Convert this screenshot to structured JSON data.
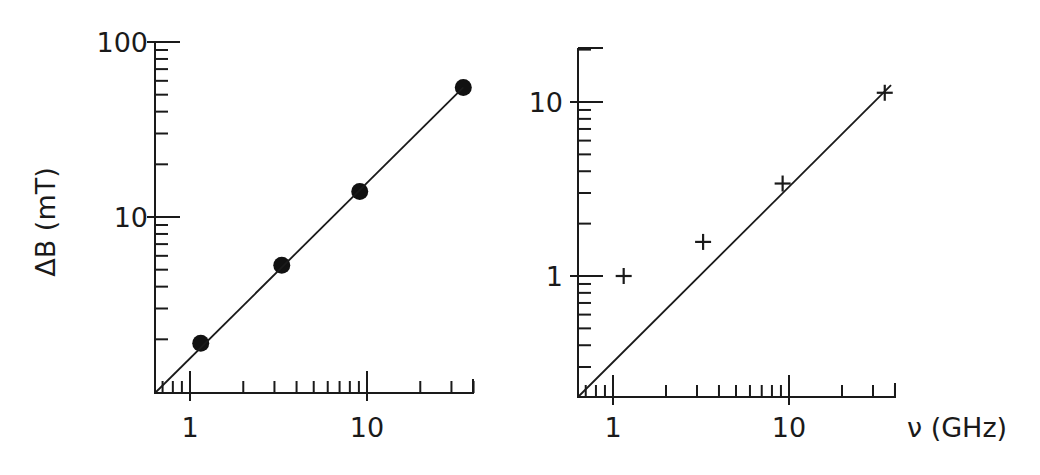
{
  "chart_data": [
    {
      "type": "scatter",
      "panel": "left",
      "title": "",
      "xlabel": "",
      "ylabel": "ΔB (mT)",
      "xscale": "log",
      "yscale": "log",
      "xlim": [
        0.63,
        40
      ],
      "ylim": [
        1,
        100
      ],
      "x_tick_labels": [
        "1",
        "10"
      ],
      "y_tick_labels": [
        "10",
        "100"
      ],
      "marker": "filled-circle",
      "grid": false,
      "series": [
        {
          "name": "data",
          "x": [
            1.15,
            3.3,
            9.1,
            35
          ],
          "y": [
            1.9,
            5.3,
            14,
            55
          ]
        },
        {
          "name": "fit",
          "kind": "line",
          "x": [
            0.63,
            35
          ],
          "y": [
            1.0,
            55
          ]
        }
      ]
    },
    {
      "type": "scatter",
      "panel": "right",
      "title": "",
      "xlabel": "ν (GHz)",
      "ylabel": "",
      "xscale": "log",
      "yscale": "log",
      "xlim": [
        0.63,
        40
      ],
      "ylim": [
        0.2,
        20
      ],
      "x_tick_labels": [
        "1",
        "10"
      ],
      "y_tick_labels": [
        "1",
        "10"
      ],
      "marker": "plus",
      "grid": false,
      "series": [
        {
          "name": "data",
          "x": [
            1.15,
            3.25,
            9.2,
            35
          ],
          "y": [
            1.0,
            1.57,
            3.4,
            11.3
          ]
        },
        {
          "name": "fit",
          "kind": "line",
          "x": [
            0.63,
            38
          ],
          "y": [
            0.2,
            12.5
          ]
        }
      ]
    }
  ],
  "labels": {
    "left_ylabel": "ΔB (mT)",
    "left_x_ticks": [
      "1",
      "10"
    ],
    "left_y_ticks": [
      "10",
      "100"
    ],
    "right_xlabel": "ν (GHz)",
    "right_x_ticks": [
      "1",
      "10"
    ],
    "right_y_ticks": [
      "1",
      "10"
    ]
  }
}
